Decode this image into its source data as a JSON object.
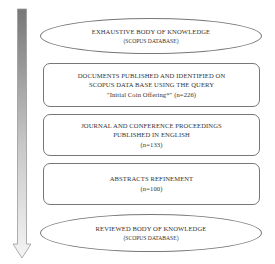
{
  "diagram": {
    "type": "flow-funnel",
    "arrow": {
      "direction": "down",
      "gradient_top": "#7a7a7a",
      "gradient_bottom": "#f2f2f2"
    },
    "steps": [
      {
        "shape": "ellipse",
        "title": "EXHAUSTIVE BODY OF KNOWLEDGE",
        "subtitle": "(SCOPUS DATABASE)"
      },
      {
        "shape": "rounded-rect",
        "line1": "DOCUMENTS PUBLISHED AND IDENTIFIED ON",
        "line2": "SCOPUS DATA BASE USING THE QUERY",
        "line3": "\"Initial Coin Offering*\" (n=226)"
      },
      {
        "shape": "rounded-rect",
        "line1": "JOURNAL AND CONFERENCE PROCEEDINGS",
        "line2": "PUBLISHED IN ENGLISH",
        "line3": "(n=133)"
      },
      {
        "shape": "rounded-rect",
        "line1": "ABSTRACTS REFINEMENT",
        "line2": "(n=100)"
      },
      {
        "shape": "ellipse",
        "title": "REVIEWED BODY OF KNOWLEDGE",
        "subtitle": "(SCOPUS DATABASE)"
      }
    ]
  }
}
